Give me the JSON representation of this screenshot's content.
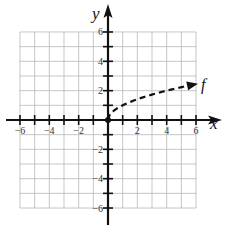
{
  "chart_data": {
    "type": "line",
    "title": "",
    "xlabel": "x",
    "ylabel": "y",
    "xlim": [
      -6,
      6
    ],
    "ylim": [
      -6,
      6
    ],
    "grid": true,
    "x_ticks": [
      -6,
      -5,
      -4,
      -3,
      -2,
      -1,
      1,
      2,
      3,
      4,
      5,
      6
    ],
    "y_ticks": [
      -6,
      -5,
      -4,
      -3,
      -2,
      -1,
      1,
      2,
      3,
      4,
      5,
      6
    ],
    "x_tick_labels": [
      "-6",
      "-4",
      "-2",
      "2",
      "4",
      "6"
    ],
    "y_tick_labels": [
      "6",
      "4",
      "2",
      "-2",
      "-4",
      "-6"
    ],
    "series": [
      {
        "name": "f",
        "style": "dashed",
        "start_marker": "closed-dot",
        "end_marker": "arrow",
        "x": [
          0,
          0.25,
          0.5,
          1,
          2,
          3,
          4,
          5,
          6
        ],
        "y": [
          0,
          0.5,
          0.71,
          1,
          1.41,
          1.73,
          2,
          2.24,
          2.45
        ]
      }
    ]
  },
  "labels": {
    "x_axis": "x",
    "y_axis": "y",
    "function": "f",
    "x_ticks": [
      "-6",
      "-4",
      "-2",
      "2",
      "4",
      "6"
    ],
    "y_ticks": [
      "6",
      "4",
      "2",
      "-2",
      "-4",
      "-6"
    ]
  },
  "colors": {
    "grid": "#b8b8b8",
    "axis": "#111111",
    "curve": "#111111",
    "text": "#333333"
  }
}
